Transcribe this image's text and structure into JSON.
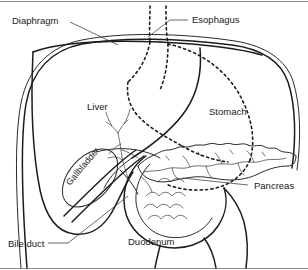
{
  "figure": {
    "background_color": "#ffffff",
    "stroke_color": "#1c1c1c",
    "width": 308,
    "height": 270
  },
  "labels": {
    "diaphragm": "Diaphragm",
    "esophagus": "Esophagus",
    "liver": "Liver",
    "stomach": "Stomach",
    "gallbladder": "Gallbladder",
    "pancreas": "Pancreas",
    "duodenum": "Duodenum",
    "bile_duct": "Bile duct"
  },
  "structures": [
    {
      "name": "diaphragm",
      "label": "Diaphragm",
      "line_style": "double-solid",
      "description": "Domed double line forming the upper and left border of the field"
    },
    {
      "name": "esophagus",
      "label": "Esophagus",
      "line_style": "dashed",
      "description": "Two dashed vertical lines descending through the diaphragm at the top centre"
    },
    {
      "name": "liver",
      "label": "Liver",
      "line_style": "solid",
      "description": "Large organ occupying the left and central upper field beneath the diaphragm"
    },
    {
      "name": "stomach",
      "label": "Stomach",
      "line_style": "dashed",
      "description": "Dashed outline on the right, largely hidden behind the liver"
    },
    {
      "name": "gallbladder",
      "label": "Gallbladder",
      "line_style": "solid",
      "description": "Tilted oval sac on the inferior liver surface, label rotated along its long axis"
    },
    {
      "name": "pancreas",
      "label": "Pancreas",
      "line_style": "solid-lobulated",
      "description": "Elongated lobulated gland crossing the midline with an internal duct"
    },
    {
      "name": "duodenum",
      "label": "Duodenum",
      "line_style": "solid",
      "description": "C-shaped loop with scalloped mucosal folds curving around the pancreatic head"
    },
    {
      "name": "bile_duct",
      "label": "Bile duct",
      "line_style": "solid",
      "description": "Duct descending from the biliary tree through the pancreatic head"
    }
  ]
}
